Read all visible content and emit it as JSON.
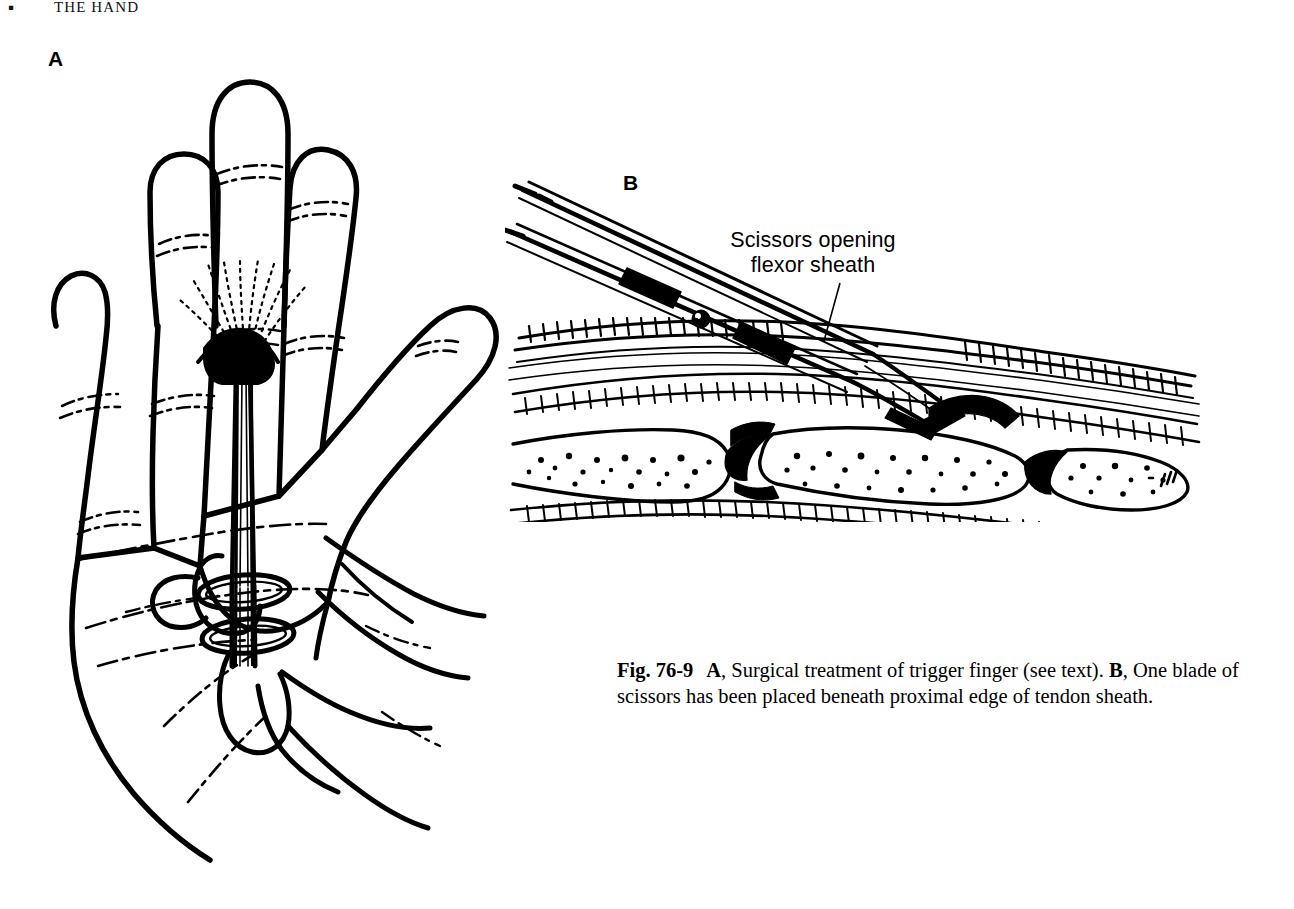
{
  "page": {
    "running_head": {
      "folio": "▪",
      "title": "THE HAND"
    },
    "background_color": "#ffffff",
    "ink_color": "#000000"
  },
  "panels": [
    {
      "letter": "A",
      "name": "panel-a",
      "subject": "Palm of hand with scissors inserted through a small incision at the distal palmar crease; surgeon's thumb and finger in the scissors rings",
      "elements": [
        "open palm, five digits",
        "finger flexion creases",
        "palmar skin creases",
        "small dark incision in distal palm",
        "scissors shank passing into incision",
        "scissors finger rings",
        "surgeon's hand gripping rings"
      ]
    },
    {
      "letter": "B",
      "name": "panel-b",
      "subject": "Sagittal section through a finger showing one blade of scissors beneath the proximal edge of the flexor tendon sheath",
      "elements": [
        "scissors shanks and box lock with screw",
        "scissors blades entering flexor sheath",
        "flexor tendon in cross hatching",
        "flexor tendon sheath",
        "metacarpal head and phalanges with trabecular bone",
        "joint spaces",
        "skin and subcutaneous layers"
      ]
    }
  ],
  "callout": {
    "line1": "Scissors opening",
    "line2": "flexor sheath",
    "leader_line": "from label down-left to scissors blade at proximal edge of sheath"
  },
  "caption": {
    "figure_number": "Fig. 76-9",
    "part_a_label": "A",
    "part_a_text": ", Surgical treatment of trigger finger (see text). ",
    "part_b_label": "B",
    "part_b_text": ", One blade of scissors has been placed beneath proximal edge of tendon sheath.",
    "full_text": "Fig. 76-9   A, Surgical treatment of trigger finger (see text). B, One blade of scissors has been placed beneath proximal edge of tendon sheath."
  }
}
